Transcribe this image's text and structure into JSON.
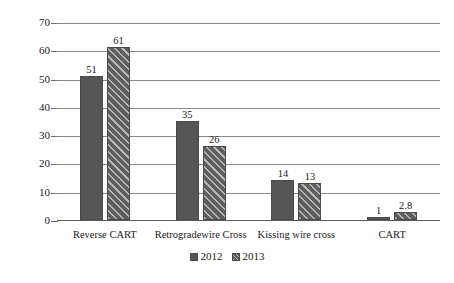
{
  "chart_data": {
    "type": "bar",
    "title": "",
    "xlabel": "",
    "ylabel": "成功率（%）",
    "ylim": [
      0,
      70
    ],
    "yticks": [
      0,
      10,
      20,
      30,
      40,
      50,
      60,
      70
    ],
    "ytick_labels": [
      "0",
      "10",
      "20",
      "30",
      "40",
      "50",
      "60",
      "70"
    ],
    "grid": "horizontal",
    "legend_position": "bottom-center",
    "categories": [
      "Reverse CART",
      "Retrogradewire Cross",
      "Kissing wire cross",
      "CART"
    ],
    "series": [
      {
        "name": "2012",
        "color": "#565656",
        "pattern": "solid",
        "values": [
          51,
          35,
          14,
          1
        ],
        "value_labels": [
          "51",
          "35",
          "14",
          "1"
        ]
      },
      {
        "name": "2013",
        "color": "#5e5e5e",
        "pattern": "diagonal-hatch",
        "values": [
          61,
          26,
          13,
          2.8
        ],
        "value_labels": [
          "61",
          "26",
          "13",
          "2.8"
        ]
      }
    ]
  },
  "legend": {
    "items": [
      {
        "label": "2012"
      },
      {
        "label": "2013"
      }
    ]
  }
}
